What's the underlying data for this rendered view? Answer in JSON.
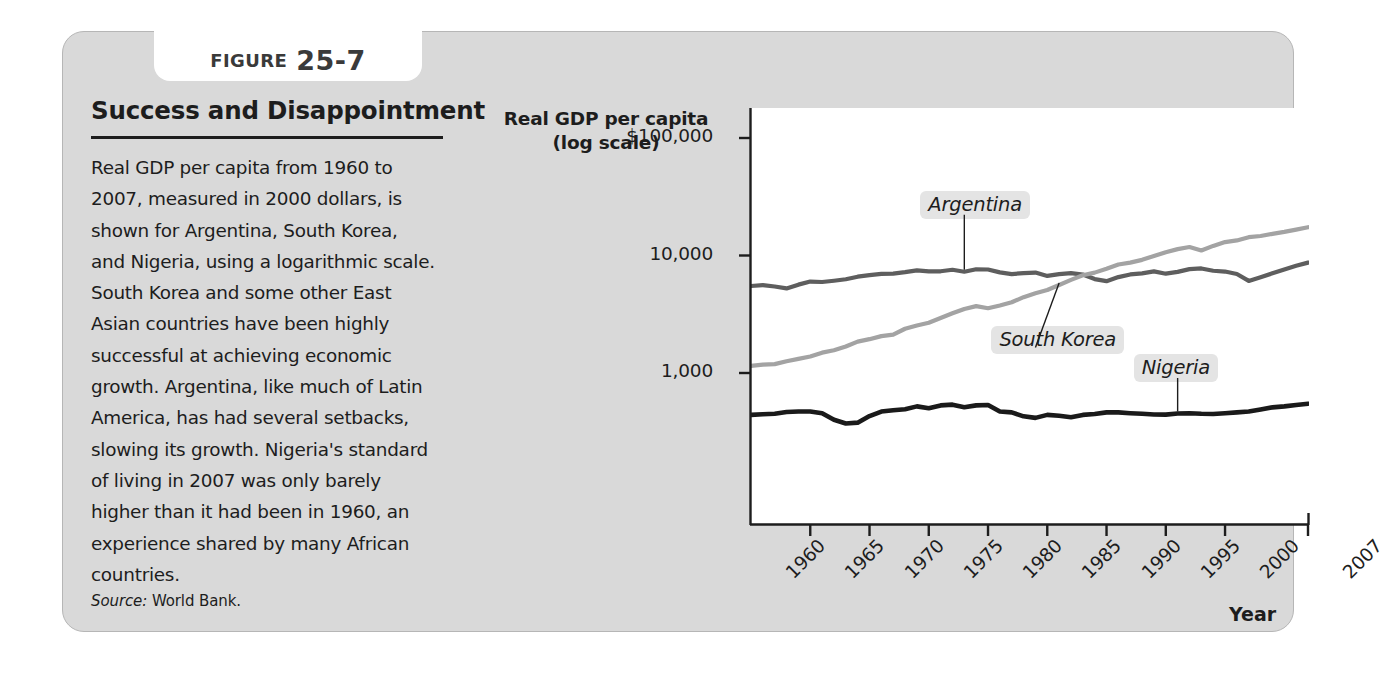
{
  "figure": {
    "tab_word": "FIGURE",
    "tab_number": "25-7",
    "title": "Success and Disappointment",
    "body": "Real GDP per capita from 1960 to 2007, measured in 2000 dollars, is shown for Argentina, South Korea, and Nigeria, using a logarithmic scale. South Korea and some other East Asian countries have been highly successful at achieving economic growth. Argentina, like much of Latin America, has had several setbacks, slowing its growth. Nigeria's standard of living in 2007 was only barely higher than it had been in 1960, an experience shared by many African countries.",
    "source_label": "Source:",
    "source_value": "World Bank."
  },
  "chart_data": {
    "type": "line",
    "title": "Success and Disappointment",
    "ylabel": "Real GDP per capita (log scale)",
    "xlabel": "Year",
    "log_scale": true,
    "grid": false,
    "legend": "inline-annotations",
    "ylim": [
      200,
      100000
    ],
    "xlim": [
      1960,
      2007
    ],
    "ytick_labels": [
      "$100,000",
      "10,000",
      "1,000"
    ],
    "ytick_values": [
      100000,
      10000,
      1000
    ],
    "xtick_labels": [
      "1960",
      "1965",
      "1970",
      "1975",
      "1980",
      "1985",
      "1990",
      "1995",
      "2000",
      "2007"
    ],
    "xtick_values": [
      1960,
      1965,
      1970,
      1975,
      1980,
      1985,
      1990,
      1995,
      2000,
      2007
    ],
    "x": [
      1960,
      1961,
      1962,
      1963,
      1964,
      1965,
      1966,
      1967,
      1968,
      1969,
      1970,
      1971,
      1972,
      1973,
      1974,
      1975,
      1976,
      1977,
      1978,
      1979,
      1980,
      1981,
      1982,
      1983,
      1984,
      1985,
      1986,
      1987,
      1988,
      1989,
      1990,
      1991,
      1992,
      1993,
      1994,
      1995,
      1996,
      1997,
      1998,
      1999,
      2000,
      2001,
      2002,
      2003,
      2004,
      2005,
      2006,
      2007
    ],
    "series": [
      {
        "name": "Argentina",
        "color": "#5e5e5e",
        "label_x": 1978,
        "label_y": 26000,
        "values": [
          5500,
          5600,
          5450,
          5250,
          5650,
          6000,
          5950,
          6100,
          6280,
          6600,
          6800,
          6980,
          7020,
          7220,
          7480,
          7320,
          7340,
          7560,
          7280,
          7640,
          7600,
          7180,
          6950,
          7080,
          7160,
          6700,
          6940,
          7070,
          6880,
          6300,
          6050,
          6550,
          6900,
          7050,
          7330,
          7000,
          7250,
          7650,
          7760,
          7420,
          7300,
          6960,
          6080,
          6540,
          7060,
          7610,
          8170,
          8700
        ]
      },
      {
        "name": "South Korea",
        "color": "#a3a3a3",
        "label_x": 1984,
        "label_y": 1850,
        "values": [
          1150,
          1180,
          1190,
          1260,
          1320,
          1380,
          1490,
          1560,
          1680,
          1850,
          1940,
          2060,
          2120,
          2380,
          2540,
          2680,
          2940,
          3220,
          3510,
          3710,
          3560,
          3760,
          4000,
          4420,
          4770,
          5090,
          5610,
          6200,
          6790,
          7150,
          7720,
          8390,
          8700,
          9180,
          9880,
          10670,
          11330,
          11800,
          11030,
          12070,
          13010,
          13430,
          14310,
          14660,
          15280,
          15890,
          16620,
          17400
        ]
      },
      {
        "name": "Nigeria",
        "color": "#1a1a1a",
        "label_x": 1996,
        "label_y": 1060,
        "values": [
          440,
          445,
          450,
          465,
          470,
          470,
          455,
          400,
          372,
          378,
          430,
          470,
          482,
          492,
          520,
          502,
          530,
          538,
          512,
          530,
          534,
          470,
          462,
          428,
          415,
          440,
          432,
          420,
          440,
          448,
          462,
          462,
          455,
          450,
          443,
          442,
          452,
          455,
          450,
          448,
          455,
          462,
          470,
          490,
          510,
          520,
          535,
          548
        ]
      }
    ]
  }
}
